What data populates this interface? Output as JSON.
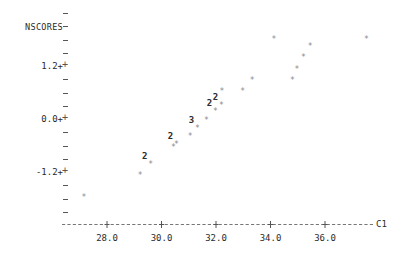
{
  "chart_data": {
    "type": "scatter",
    "title": "",
    "ylabel": "NSCORES",
    "xlabel": "C1",
    "xlim": [
      26.6,
      37.6
    ],
    "ylim": [
      -2.05,
      1.95
    ],
    "grid": false,
    "legend": null,
    "x_ticks": [
      {
        "label": "28.0",
        "value": 28.0
      },
      {
        "label": "30.0",
        "value": 30.0
      },
      {
        "label": "32.0",
        "value": 32.0
      },
      {
        "label": "34.0",
        "value": 34.0
      },
      {
        "label": "36.0",
        "value": 36.0
      }
    ],
    "y_ticks": [
      {
        "label": "1.2+",
        "value": 1.2
      },
      {
        "label": "0.0+",
        "value": 0.0
      },
      {
        "label": "-1.2+",
        "value": -1.2
      }
    ],
    "marker": "*",
    "points": [
      {
        "x": 27.15,
        "y": -1.78,
        "count": 1,
        "label": "*"
      },
      {
        "x": 29.22,
        "y": -1.3,
        "count": 1,
        "label": "*"
      },
      {
        "x": 29.6,
        "y": -1.05,
        "count": 2,
        "label": "2"
      },
      {
        "x": 30.44,
        "y": -0.65,
        "count": 1,
        "label": "*"
      },
      {
        "x": 30.55,
        "y": -0.58,
        "count": 2,
        "label": "2"
      },
      {
        "x": 31.05,
        "y": -0.4,
        "count": 1,
        "label": "*"
      },
      {
        "x": 31.32,
        "y": -0.23,
        "count": 3,
        "label": "3"
      },
      {
        "x": 31.65,
        "y": -0.05,
        "count": 1,
        "label": "*"
      },
      {
        "x": 31.98,
        "y": 0.15,
        "count": 2,
        "label": "2"
      },
      {
        "x": 32.2,
        "y": 0.3,
        "count": 2,
        "label": "2"
      },
      {
        "x": 32.22,
        "y": 0.62,
        "count": 1,
        "label": "*"
      },
      {
        "x": 32.98,
        "y": 0.62,
        "count": 1,
        "label": "*"
      },
      {
        "x": 33.33,
        "y": 0.87,
        "count": 1,
        "label": "*"
      },
      {
        "x": 34.8,
        "y": 0.87,
        "count": 1,
        "label": "*"
      },
      {
        "x": 34.97,
        "y": 1.1,
        "count": 1,
        "label": "*"
      },
      {
        "x": 35.21,
        "y": 1.38,
        "count": 1,
        "label": "*"
      },
      {
        "x": 35.46,
        "y": 1.62,
        "count": 1,
        "label": "*"
      },
      {
        "x": 37.52,
        "y": 1.8,
        "count": 1,
        "label": "*"
      },
      {
        "x": 34.13,
        "y": 1.8,
        "count": 1,
        "label": "*"
      }
    ]
  },
  "axis_decoration": {
    "y_minor_glyph": "-",
    "y_major_glyph": "+",
    "x_line_glyph": "-",
    "x_tick_glyph": "+"
  }
}
